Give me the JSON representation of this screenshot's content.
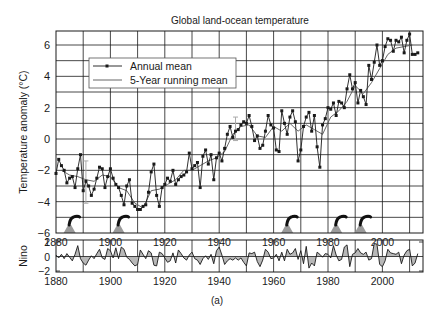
{
  "figure": {
    "caption": "(a)"
  },
  "chart_data": [
    {
      "type": "line",
      "title": "Global land-ocean temperature",
      "xlabel": "",
      "ylabel": "Temperature anomaly (°C)",
      "xlim": [
        1880,
        2015
      ],
      "ylim": [
        -6,
        7
      ],
      "xticks": [
        1880,
        1900,
        1920,
        1940,
        1960,
        1980,
        2000
      ],
      "yticks": [
        -6,
        -4,
        -2,
        0,
        2,
        4,
        6
      ],
      "grid": true,
      "grid_x_step": 10,
      "grid_y_step": 1,
      "legend": {
        "position": "upper-left",
        "entries": [
          "Annual mean",
          "5-Year running mean"
        ]
      },
      "series": [
        {
          "name": "Annual mean",
          "marker": "square",
          "color": "#1a1a1a",
          "x": [
            1880,
            1881,
            1882,
            1883,
            1884,
            1885,
            1886,
            1887,
            1888,
            1889,
            1890,
            1891,
            1892,
            1893,
            1894,
            1895,
            1896,
            1897,
            1898,
            1899,
            1900,
            1901,
            1902,
            1903,
            1904,
            1905,
            1906,
            1907,
            1908,
            1909,
            1910,
            1911,
            1912,
            1913,
            1914,
            1915,
            1916,
            1917,
            1918,
            1919,
            1920,
            1921,
            1922,
            1923,
            1924,
            1925,
            1926,
            1927,
            1928,
            1929,
            1930,
            1931,
            1932,
            1933,
            1934,
            1935,
            1936,
            1937,
            1938,
            1939,
            1940,
            1941,
            1942,
            1943,
            1944,
            1945,
            1946,
            1947,
            1948,
            1949,
            1950,
            1951,
            1952,
            1953,
            1954,
            1955,
            1956,
            1957,
            1958,
            1959,
            1960,
            1961,
            1962,
            1963,
            1964,
            1965,
            1966,
            1967,
            1968,
            1969,
            1970,
            1971,
            1972,
            1973,
            1974,
            1975,
            1976,
            1977,
            1978,
            1979,
            1980,
            1981,
            1982,
            1983,
            1984,
            1985,
            1986,
            1987,
            1988,
            1989,
            1990,
            1991,
            1992,
            1993,
            1994,
            1995,
            1996,
            1997,
            1998,
            1999,
            2000,
            2001,
            2002,
            2003,
            2004,
            2005,
            2006,
            2007,
            2008,
            2009,
            2010,
            2011,
            2012,
            2013
          ],
          "values": [
            -2.2,
            -1.3,
            -1.7,
            -2.0,
            -2.8,
            -2.5,
            -2.4,
            -3.1,
            -1.9,
            -1.0,
            -3.3,
            -2.7,
            -3.0,
            -3.6,
            -3.2,
            -2.5,
            -1.8,
            -1.9,
            -3.1,
            -2.4,
            -1.9,
            -2.5,
            -2.9,
            -3.1,
            -3.6,
            -4.2,
            -3.0,
            -2.6,
            -4.1,
            -4.3,
            -4.5,
            -4.5,
            -4.3,
            -4.2,
            -3.4,
            -2.1,
            -1.6,
            -3.6,
            -4.3,
            -3.1,
            -2.9,
            -2.5,
            -2.7,
            -2.0,
            -2.9,
            -2.6,
            -2.4,
            -2.3,
            -2.1,
            -0.9,
            -1.9,
            -1.7,
            -1.5,
            -3.1,
            -1.1,
            -0.7,
            -1.6,
            -1.0,
            -2.6,
            -1.2,
            -0.9,
            -1.4,
            -0.6,
            0.3,
            0.8,
            0.1,
            0.5,
            0.6,
            0.9,
            1.1,
            1.0,
            1.5,
            0.8,
            -0.1,
            0.2,
            -0.6,
            -0.4,
            0.5,
            1.5,
            0.9,
            0.7,
            -0.7,
            -0.8,
            1.8,
            1.0,
            0.3,
            1.4,
            1.8,
            1.1,
            -1.4,
            -0.7,
            0.8,
            1.4,
            1.7,
            0.5,
            1.5,
            -0.5,
            -1.8,
            0.9,
            1.3,
            2.0,
            1.9,
            2.3,
            1.5,
            2.4,
            2.3,
            2.0,
            3.2,
            4.1,
            3.2,
            3.6,
            2.3,
            3.1,
            2.7,
            2.2,
            4.7,
            3.8,
            4.9,
            6.0,
            4.7,
            5.0,
            5.9,
            6.4,
            6.3,
            5.6,
            6.3,
            6.2,
            6.5,
            5.5,
            6.3,
            6.7,
            5.4,
            5.4,
            5.5
          ],
          "note": "values read off the plot, in °C anomaly units as labeled (axis scale ×0.1 °C)"
        },
        {
          "name": "5-Year running mean",
          "marker": "none",
          "color": "#555555",
          "x": [
            1882,
            1885,
            1888,
            1891,
            1894,
            1897,
            1900,
            1903,
            1906,
            1909,
            1912,
            1915,
            1918,
            1921,
            1924,
            1927,
            1930,
            1933,
            1936,
            1939,
            1942,
            1945,
            1948,
            1951,
            1954,
            1957,
            1960,
            1963,
            1966,
            1969,
            1972,
            1975,
            1978,
            1981,
            1984,
            1987,
            1990,
            1993,
            1996,
            1999,
            2002,
            2005,
            2008,
            2011
          ],
          "values": [
            -2.0,
            -2.3,
            -2.4,
            -2.6,
            -2.7,
            -2.3,
            -2.4,
            -3.1,
            -3.3,
            -4.1,
            -4.4,
            -3.3,
            -3.2,
            -2.9,
            -2.6,
            -2.0,
            -2.0,
            -1.7,
            -1.4,
            -1.2,
            -0.8,
            0.3,
            0.8,
            0.9,
            0.2,
            0.1,
            0.8,
            0.5,
            1.0,
            0.5,
            0.9,
            0.6,
            0.3,
            1.4,
            1.8,
            2.4,
            3.4,
            2.9,
            3.6,
            4.5,
            5.4,
            5.8,
            5.9,
            6.0
          ]
        }
      ],
      "annotations": {
        "volcanic_eruptions": [
          1885,
          1903,
          1965,
          1983,
          1992
        ],
        "error_bars": [
          {
            "x": 1891,
            "y_low": -4.1,
            "y_high": -1.4
          },
          {
            "x": 1946,
            "y_low": -0.1,
            "y_high": 1.4
          }
        ]
      }
    },
    {
      "type": "area",
      "title": "",
      "xlabel": "",
      "ylabel": "Nino",
      "xlim": [
        1880,
        2015
      ],
      "ylim": [
        -2.4,
        2.4
      ],
      "xticks": [
        1880,
        1900,
        1920,
        1940,
        1960,
        1980,
        2000
      ],
      "yticks": [
        -2,
        0,
        2
      ],
      "grid": true,
      "grid_x_step": 10,
      "series": [
        {
          "name": "Nino index",
          "color": "#1a1a1a",
          "fill": "#b8b8b8",
          "x": [
            1880,
            1881,
            1882,
            1883,
            1884,
            1885,
            1886,
            1887,
            1888,
            1889,
            1890,
            1891,
            1892,
            1893,
            1894,
            1895,
            1896,
            1897,
            1898,
            1899,
            1900,
            1901,
            1902,
            1903,
            1904,
            1905,
            1906,
            1907,
            1908,
            1909,
            1910,
            1911,
            1912,
            1913,
            1914,
            1915,
            1916,
            1917,
            1918,
            1919,
            1920,
            1921,
            1922,
            1923,
            1924,
            1925,
            1926,
            1927,
            1928,
            1929,
            1930,
            1931,
            1932,
            1933,
            1934,
            1935,
            1936,
            1937,
            1938,
            1939,
            1940,
            1941,
            1942,
            1943,
            1944,
            1945,
            1946,
            1947,
            1948,
            1949,
            1950,
            1951,
            1952,
            1953,
            1954,
            1955,
            1956,
            1957,
            1958,
            1959,
            1960,
            1961,
            1962,
            1963,
            1964,
            1965,
            1966,
            1967,
            1968,
            1969,
            1970,
            1971,
            1972,
            1973,
            1974,
            1975,
            1976,
            1977,
            1978,
            1979,
            1980,
            1981,
            1982,
            1983,
            1984,
            1985,
            1986,
            1987,
            1988,
            1989,
            1990,
            1991,
            1992,
            1993,
            1994,
            1995,
            1996,
            1997,
            1998,
            1999,
            2000,
            2001,
            2002,
            2003,
            2004,
            2005,
            2006,
            2007,
            2008,
            2009,
            2010,
            2011,
            2012,
            2013
          ],
          "values": [
            0.2,
            -0.2,
            0.3,
            -0.3,
            0.4,
            -0.1,
            -0.6,
            0.3,
            1.5,
            -0.3,
            -0.9,
            -1.2,
            -0.5,
            0.1,
            -0.3,
            0.4,
            1.0,
            -0.2,
            -0.4,
            1.1,
            0.8,
            -0.2,
            1.2,
            -0.3,
            1.3,
            1.0,
            -0.1,
            -0.4,
            -0.9,
            -1.3,
            -1.1,
            0.9,
            0.3,
            -0.3,
            0.8,
            0.5,
            -1.2,
            -1.3,
            0.6,
            0.4,
            -0.2,
            -0.8,
            -0.6,
            0.5,
            -0.9,
            0.9,
            0.4,
            -0.2,
            -0.5,
            0.2,
            0.6,
            -0.3,
            -0.5,
            -1.1,
            -0.3,
            0.1,
            -0.4,
            0.3,
            -1.0,
            0.8,
            1.3,
            0.2,
            -1.1,
            -0.6,
            -0.3,
            -0.5,
            -0.2,
            -0.5,
            -0.2,
            -0.8,
            -1.3,
            0.5,
            0.4,
            0.6,
            -0.7,
            -1.4,
            -0.5,
            1.0,
            0.6,
            -0.3,
            -0.2,
            0.3,
            -0.6,
            0.6,
            -0.6,
            1.0,
            0.3,
            0.5,
            1.1,
            -0.4,
            0.8,
            -1.0,
            1.4,
            -1.6,
            -0.9,
            -1.3,
            0.6,
            0.3,
            -0.1,
            0.4,
            0.3,
            -0.2,
            1.5,
            0.2,
            -0.6,
            -0.4,
            1.3,
            1.6,
            -1.4,
            0.3,
            0.5,
            1.1,
            0.5,
            0.3,
            0.6,
            -0.5,
            -0.3,
            1.8,
            1.7,
            -1.1,
            -1.4,
            -0.6,
            1.0,
            0.5,
            0.4,
            0.3,
            0.6,
            -1.0,
            0.2,
            0.8,
            1.0,
            -1.3,
            -0.9,
            0.4
          ]
        }
      ]
    }
  ]
}
